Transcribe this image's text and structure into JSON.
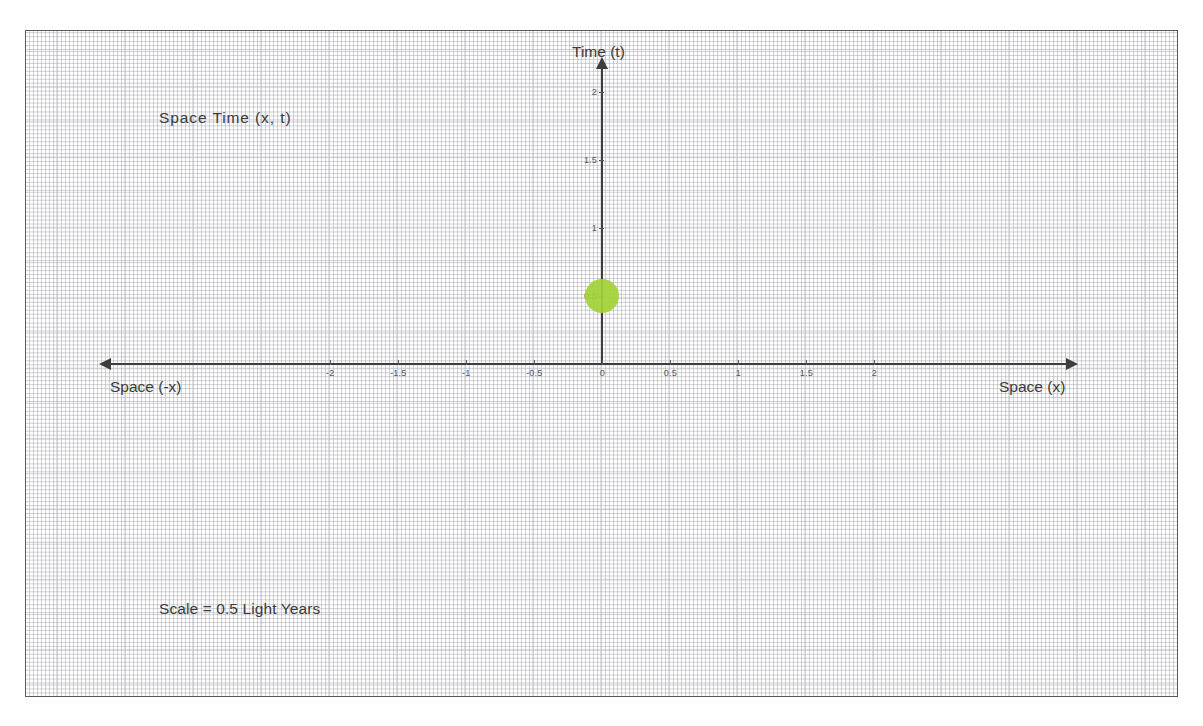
{
  "diagram": {
    "title": "Space  Time  (x, t)",
    "scale_note": "Scale = 0.5 Light Years",
    "time_axis_label": "Time (t)",
    "space_positive_label": "Space (x)",
    "space_negative_label": "Space (-x)"
  },
  "colors": {
    "event_marker": "#a2d236",
    "axis": "#3d3d3d",
    "grid": "#b4b4bc",
    "frame_border": "#5a5a5a",
    "text": "#3b3b3b",
    "tick_text": "#55555d",
    "background": "#ffffff"
  },
  "chart_data": {
    "type": "scatter",
    "title": "Space  Time  (x, t)",
    "xlabel": "Space (x)",
    "ylabel": "Time (t)",
    "xlim": [
      -2.5,
      2.5
    ],
    "ylim": [
      0,
      2.2
    ],
    "grid": true,
    "legend": "none",
    "x_ticks": [
      -2,
      -1.5,
      -1,
      -0.5,
      0,
      0.5,
      1,
      1.5,
      2
    ],
    "x_tick_labels": [
      "-2",
      "-1.5",
      "-1",
      "-0.5",
      "0",
      "0.5",
      "1",
      "1.5",
      "2"
    ],
    "y_ticks": [
      0.5,
      1,
      1.5,
      2
    ],
    "y_tick_labels": [
      "0.5",
      "1",
      "1.5",
      "2"
    ],
    "unit_per_tick": 0.5,
    "unit_name": "Light Years",
    "series": [
      {
        "name": "event",
        "marker": "circle",
        "color": "#a2d236",
        "points": [
          {
            "x": 0,
            "t": 0.5
          }
        ]
      }
    ],
    "annotations": [
      {
        "text": "Space  Time  (x, t)",
        "position": "upper-left"
      },
      {
        "text": "Scale = 0.5 Light Years",
        "position": "lower-left"
      },
      {
        "text": "Space (-x)",
        "position": "x-axis-left-end"
      },
      {
        "text": "Space (x)",
        "position": "x-axis-right-end"
      },
      {
        "text": "Time (t)",
        "position": "t-axis-top"
      }
    ]
  }
}
